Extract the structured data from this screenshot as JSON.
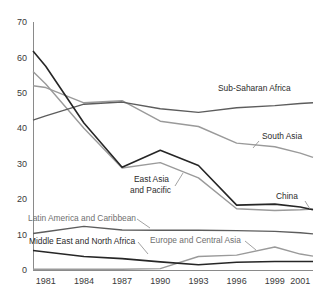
{
  "chart_data": {
    "type": "line",
    "title": "",
    "subtitle": "",
    "xlabel": "",
    "ylabel": "",
    "grid": false,
    "legend_position": "inline-annotations",
    "x": [
      1981,
      1984,
      1987,
      1990,
      1993,
      1996,
      1999,
      2001
    ],
    "xlim": [
      1980,
      2002
    ],
    "ylim": [
      0,
      70
    ],
    "x_tick_labels": [
      "1981",
      "1984",
      "1987",
      "1990",
      "1993",
      "1996",
      "1999",
      "2001"
    ],
    "y_ticks": [
      0,
      10,
      20,
      30,
      40,
      50,
      60,
      70
    ],
    "y_tick_labels": [
      "0",
      "10",
      "20",
      "30",
      "40",
      "50",
      "60",
      "70"
    ],
    "series": [
      {
        "name": "Sub-Saharan Africa",
        "color": "#5d5d5d",
        "style": "mid",
        "x": [
          1980,
          1981,
          1984,
          1987,
          1990,
          1993,
          1996,
          1999,
          2001,
          2002
        ],
        "values": [
          42.3,
          43.5,
          46.8,
          47.4,
          45.5,
          44.5,
          45.8,
          46.4,
          47.0,
          47.2
        ]
      },
      {
        "name": "South Asia",
        "color": "#9a9a9a",
        "style": "gray",
        "x": [
          1980,
          1981,
          1984,
          1987,
          1990,
          1993,
          1996,
          1999,
          2001,
          2002
        ],
        "values": [
          52.0,
          51.5,
          47.2,
          47.8,
          42.0,
          40.5,
          35.8,
          34.8,
          33.0,
          31.8
        ]
      },
      {
        "name": "China",
        "color": "#262626",
        "style": "dark",
        "x": [
          1980,
          1981,
          1984,
          1987,
          1990,
          1993,
          1996,
          1999,
          2001,
          2002
        ],
        "values": [
          61.8,
          57.5,
          41.5,
          29.0,
          33.8,
          29.5,
          18.3,
          18.6,
          17.8,
          17.0
        ]
      },
      {
        "name": "East Asia and Pacific",
        "color": "#9a9a9a",
        "style": "gray",
        "x": [
          1980,
          1981,
          1984,
          1987,
          1990,
          1993,
          1996,
          1999,
          2001,
          2002
        ],
        "values": [
          56.0,
          52.5,
          40.0,
          28.8,
          30.3,
          26.0,
          17.3,
          16.8,
          17.0,
          17.2
        ]
      },
      {
        "name": "Latin America and Caribbean",
        "color": "#5d5d5d",
        "style": "mid",
        "x": [
          1980,
          1981,
          1984,
          1987,
          1990,
          1993,
          1996,
          1999,
          2001,
          2002
        ],
        "values": [
          10.3,
          10.8,
          12.3,
          11.3,
          11.2,
          11.2,
          11.1,
          10.9,
          10.5,
          10.2
        ]
      },
      {
        "name": "Middle East and North Africa",
        "color": "#262626",
        "style": "dark",
        "x": [
          1980,
          1981,
          1984,
          1987,
          1990,
          1993,
          1996,
          1999,
          2001,
          2002
        ],
        "values": [
          5.5,
          5.1,
          3.8,
          3.2,
          2.3,
          1.5,
          2.2,
          2.4,
          2.4,
          2.4
        ]
      },
      {
        "name": "Europe and Central Asia",
        "color": "#9a9a9a",
        "style": "gray",
        "x": [
          1980,
          1981,
          1984,
          1987,
          1990,
          1993,
          1996,
          1999,
          2001,
          2002
        ],
        "values": [
          0.2,
          0.2,
          0.2,
          0.2,
          0.4,
          3.8,
          4.2,
          6.5,
          4.5,
          3.9
        ]
      }
    ],
    "annotations": [
      {
        "text": "Sub-Saharan Africa",
        "x": 218,
        "y": 91,
        "anchor": "start",
        "tone": "dark",
        "leader": ""
      },
      {
        "text": "South Asia",
        "x": 262,
        "y": 139,
        "anchor": "start",
        "tone": "dark",
        "leader": "M259,141 L253,148"
      },
      {
        "text": "East Asia",
        "x": 134,
        "y": 182,
        "anchor": "start",
        "tone": "dark",
        "leader": "M175,186 L183,173"
      },
      {
        "text": "and Pacific",
        "x": 130,
        "y": 193,
        "anchor": "start",
        "tone": "dark",
        "leader": ""
      },
      {
        "text": "China",
        "x": 276,
        "y": 199,
        "anchor": "start",
        "tone": "dark",
        "leader": "M305,201 L310,209"
      },
      {
        "text": "Latin America and Caribbean",
        "x": 28,
        "y": 221,
        "anchor": "start",
        "tone": "light",
        "leader": "M137,219 L150,228"
      },
      {
        "text": "Middle East and North Africa",
        "x": 29,
        "y": 244,
        "anchor": "start",
        "tone": "dark",
        "leader": "M138,242 L148,254"
      },
      {
        "text": "Europe and Central Asia",
        "x": 150,
        "y": 243,
        "anchor": "start",
        "tone": "light",
        "leader": "M245,241 L256,250"
      }
    ]
  },
  "colors": {
    "axis": "#8a8a8a",
    "dark_series": "#262626",
    "mid_series": "#5d5d5d",
    "light_series": "#9a9a9a",
    "background": "#ffffff",
    "text": "#2b2b2b"
  }
}
